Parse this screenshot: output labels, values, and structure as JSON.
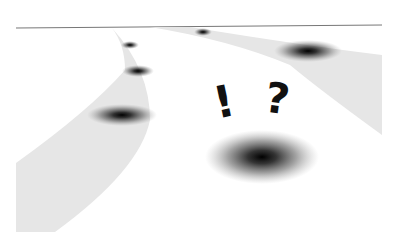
{
  "illustration": {
    "description": "Two roads diverging toward a horizon with blurry shadowy spots and a large shadow with exclamation and question marks",
    "symbols": {
      "exclamation": "!",
      "question": "?"
    },
    "colors": {
      "background": "#ffffff",
      "road": "#e6e6e6",
      "horizon": "#777777",
      "spot": "#111111",
      "glyph": "#111111"
    }
  }
}
